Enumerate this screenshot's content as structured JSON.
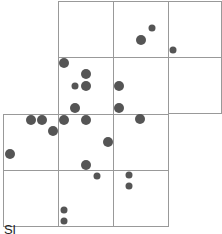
{
  "figure": {
    "caption": "Sl",
    "colors": {
      "grid": "#999999",
      "dot": "#555555",
      "background": "#ffffff"
    },
    "grid_cells": [
      {
        "x": 58,
        "y": 1,
        "w": 55,
        "h": 56
      },
      {
        "x": 113,
        "y": 1,
        "w": 55,
        "h": 56
      },
      {
        "x": 168,
        "y": 1,
        "w": 53,
        "h": 56
      },
      {
        "x": 58,
        "y": 57,
        "w": 55,
        "h": 57
      },
      {
        "x": 113,
        "y": 57,
        "w": 55,
        "h": 57
      },
      {
        "x": 168,
        "y": 57,
        "w": 53,
        "h": 56
      },
      {
        "x": 3,
        "y": 114,
        "w": 55,
        "h": 56
      },
      {
        "x": 58,
        "y": 114,
        "w": 55,
        "h": 56
      },
      {
        "x": 113,
        "y": 114,
        "w": 55,
        "h": 56
      },
      {
        "x": 3,
        "y": 170,
        "w": 55,
        "h": 56
      },
      {
        "x": 58,
        "y": 170,
        "w": 55,
        "h": 56
      },
      {
        "x": 113,
        "y": 170,
        "w": 55,
        "h": 56
      }
    ],
    "dots": [
      {
        "x": 152,
        "y": 28,
        "r": 3.5
      },
      {
        "x": 141,
        "y": 40,
        "r": 5
      },
      {
        "x": 173,
        "y": 50,
        "r": 3.5
      },
      {
        "x": 64,
        "y": 63,
        "r": 5
      },
      {
        "x": 86,
        "y": 74,
        "r": 5
      },
      {
        "x": 75,
        "y": 86,
        "r": 3.5
      },
      {
        "x": 86,
        "y": 86,
        "r": 5
      },
      {
        "x": 119,
        "y": 86,
        "r": 5
      },
      {
        "x": 75,
        "y": 108,
        "r": 5
      },
      {
        "x": 119,
        "y": 108,
        "r": 5
      },
      {
        "x": 31,
        "y": 120,
        "r": 5
      },
      {
        "x": 42,
        "y": 120,
        "r": 5
      },
      {
        "x": 64,
        "y": 120,
        "r": 5
      },
      {
        "x": 86,
        "y": 120,
        "r": 5
      },
      {
        "x": 140,
        "y": 119,
        "r": 5
      },
      {
        "x": 53,
        "y": 131,
        "r": 5
      },
      {
        "x": 108,
        "y": 142,
        "r": 5
      },
      {
        "x": 10,
        "y": 154,
        "r": 5
      },
      {
        "x": 86,
        "y": 165,
        "r": 5
      },
      {
        "x": 97,
        "y": 176,
        "r": 3.5
      },
      {
        "x": 129,
        "y": 175,
        "r": 3.5
      },
      {
        "x": 129,
        "y": 186,
        "r": 3.5
      },
      {
        "x": 64,
        "y": 210,
        "r": 3.5
      },
      {
        "x": 64,
        "y": 221,
        "r": 3.5
      }
    ]
  }
}
